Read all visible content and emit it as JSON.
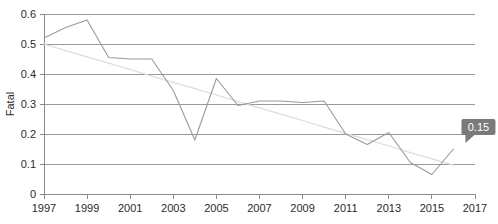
{
  "chart_data": {
    "type": "line",
    "title": "",
    "xlabel": "",
    "ylabel": "Fatal",
    "xlim": [
      1997,
      2017
    ],
    "ylim": [
      0,
      0.6
    ],
    "grid": true,
    "legend": "none",
    "x_ticks": [
      "1997",
      "1999",
      "2001",
      "2003",
      "2005",
      "2007",
      "2009",
      "2011",
      "2013",
      "2015",
      "2017"
    ],
    "y_ticks": [
      "0",
      "0.1",
      "0.2",
      "0.3",
      "0.4",
      "0.5",
      "0.6"
    ],
    "x": [
      1997,
      1998,
      1999,
      2000,
      2001,
      2002,
      2003,
      2004,
      2005,
      2006,
      2007,
      2008,
      2009,
      2010,
      2011,
      2012,
      2013,
      2014,
      2015,
      2016
    ],
    "series": [
      {
        "name": "Fatal",
        "color": "#9a9a9a",
        "values": [
          0.52,
          0.555,
          0.58,
          0.455,
          0.45,
          0.45,
          0.345,
          0.18,
          0.385,
          0.295,
          0.31,
          0.31,
          0.305,
          0.31,
          0.2,
          0.165,
          0.205,
          0.105,
          0.065,
          0.15
        ]
      },
      {
        "name": "trend",
        "color": "#dcdcdc",
        "values": [
          0.5,
          0.478,
          0.457,
          0.436,
          0.415,
          0.393,
          0.372,
          0.351,
          0.33,
          0.308,
          0.287,
          0.266,
          0.245,
          0.223,
          0.202,
          0.181,
          0.16,
          0.138,
          0.117,
          0.096
        ]
      }
    ],
    "annotations": [
      {
        "name": "value-tooltip",
        "label": "0.15",
        "x": 2016,
        "y": 0.15,
        "background": "#7a7a7a",
        "text_color": "#ffffff"
      }
    ]
  }
}
